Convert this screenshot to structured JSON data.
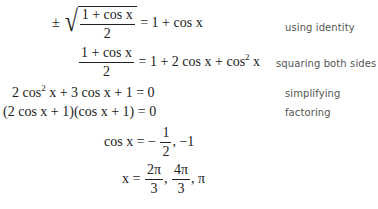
{
  "derivation": {
    "steps": [
      {
        "lhs_prefix": "±",
        "lhs_sqrt_num": "1 + cos x",
        "lhs_sqrt_den": "2",
        "rhs": "= 1 + cos x",
        "label": "using identity"
      },
      {
        "lhs_num": "1 + cos x",
        "lhs_den": "2",
        "rhs_a": "= 1 + 2 cos x + cos",
        "rhs_sup": "2",
        "rhs_b": " x",
        "label": "squaring both sides"
      },
      {
        "lhs_a": "2 cos",
        "lhs_sup": "2",
        "lhs_b": " x + 3 cos x + 1 = 0",
        "label": "simplifying"
      },
      {
        "expr": "(2 cos x + 1)(cos x + 1) = 0",
        "label": "factoring"
      },
      {
        "lhs": "cos x = −",
        "frac_num": "1",
        "frac_den": "2",
        "rhs_tail": ", −1"
      },
      {
        "lhs": "x =",
        "frac1_num": "2π",
        "frac1_den": "3",
        "sep": ",",
        "frac2_num": "4π",
        "frac2_den": "3",
        "tail": ", π"
      }
    ]
  }
}
